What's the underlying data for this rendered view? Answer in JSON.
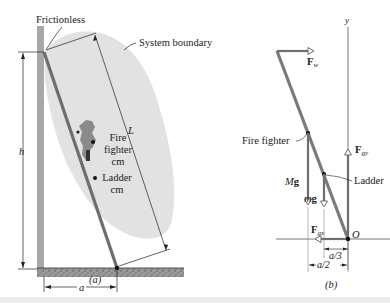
{
  "figure": {
    "panel_a": {
      "caption": "(a)",
      "labels": {
        "frictionless": "Frictionless",
        "system_boundary": "System boundary",
        "length": "L",
        "height": "h",
        "base": "a",
        "fire_fighter_cm_line1": "Fire",
        "fire_fighter_cm_line2": "fighter",
        "fire_fighter_cm_line3": "cm",
        "ladder_cm_line1": "Ladder",
        "ladder_cm_line2": "cm"
      }
    },
    "panel_b": {
      "caption": "(b)",
      "labels": {
        "y_axis": "y",
        "origin": "O",
        "force_wall": "F",
        "force_wall_sub": "w",
        "force_ground_y": "F",
        "force_ground_y_sub": "gy",
        "force_ground_x": "F",
        "force_ground_x_sub": "gx",
        "fire_fighter": "Fire fighter",
        "ladder": "Ladder",
        "weight_fire_fighter_M": "M",
        "weight_fire_fighter_g": "g",
        "weight_ladder_m": "m",
        "weight_ladder_g": "g",
        "dist_a3": "a/3",
        "dist_a2": "a/2"
      }
    },
    "colors": {
      "wall": "#a8a8a8",
      "ladder": "#7a7a7a",
      "boundary_fill": "#e2e2e2",
      "ink": "#1a1a1a",
      "ground": "#8c8c8c"
    }
  }
}
